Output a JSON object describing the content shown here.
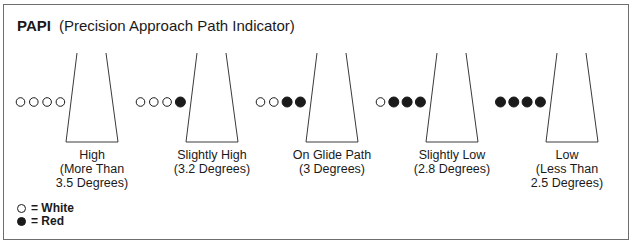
{
  "title": {
    "abbreviation": "PAPI",
    "full_name": "(Precision Approach Path Indicator)"
  },
  "colors": {
    "white_light": "#ffffff",
    "red_light": "#1a1a1a",
    "stroke": "#3a3a3a",
    "frame": "#6e6e6e"
  },
  "indications": [
    {
      "label": "High",
      "detail_1": "(More Than",
      "detail_2": "3.5 Degrees)",
      "lights": [
        "white",
        "white",
        "white",
        "white"
      ]
    },
    {
      "label": "Slightly High",
      "detail_1": "(3.2 Degrees)",
      "detail_2": "",
      "lights": [
        "white",
        "white",
        "white",
        "red"
      ]
    },
    {
      "label": "On Glide Path",
      "detail_1": "(3 Degrees)",
      "detail_2": "",
      "lights": [
        "white",
        "white",
        "red",
        "red"
      ]
    },
    {
      "label": "Slightly Low",
      "detail_1": "(2.8 Degrees)",
      "detail_2": "",
      "lights": [
        "white",
        "red",
        "red",
        "red"
      ]
    },
    {
      "label": "Low",
      "detail_1": "(Less Than",
      "detail_2": "2.5 Degrees)",
      "lights": [
        "red",
        "red",
        "red",
        "red"
      ]
    }
  ],
  "legend": {
    "white": "= White",
    "red": "= Red"
  }
}
